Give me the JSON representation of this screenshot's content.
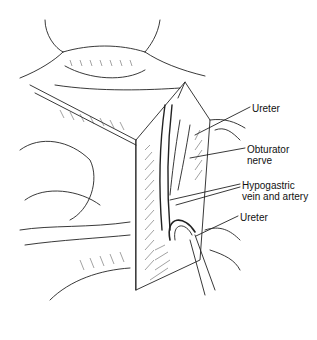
{
  "figure": {
    "labels": [
      {
        "id": "ureter-upper",
        "text": "Ureter",
        "x": 252,
        "y": 103
      },
      {
        "id": "obturator-nerve",
        "line1": "Obturator",
        "line2": "nerve",
        "x": 247,
        "y": 144
      },
      {
        "id": "hypogastric",
        "line1": "Hypogastric",
        "line2": "vein and artery",
        "x": 242,
        "y": 180
      },
      {
        "id": "ureter-lower",
        "text": "Ureter",
        "x": 240,
        "y": 212
      }
    ]
  }
}
